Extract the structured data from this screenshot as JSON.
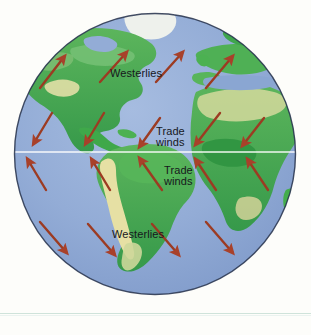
{
  "figure": {
    "background_color": "#fdfdfa",
    "rule_color": "#cfe3da"
  },
  "globe": {
    "center_x": 155,
    "center_y": 154,
    "radius": 141,
    "ocean_color": "#8fa9d4",
    "ocean_color_light": "#9db5dc",
    "land_green": "#3faa4a",
    "land_green_dark": "#2e8b3d",
    "land_green_light": "#7cc47d",
    "desert_tan": "#e8e3a8",
    "ice_white": "#f2f4ef",
    "outline_color": "#1b2a44",
    "equator_color": "#ffffff",
    "equator_y": 152
  },
  "arrows": {
    "color": "#9c3b22",
    "head_color": "#b0442a",
    "stroke_width": 2.4,
    "bands": [
      {
        "name": "north-westerlies",
        "direction": "northeast",
        "count": 4,
        "label": "Westerlies"
      },
      {
        "name": "north-trade-winds",
        "direction": "southwest",
        "count": 5,
        "label": "Trade\nwinds"
      },
      {
        "name": "south-trade-winds",
        "direction": "northwest",
        "count": 5,
        "label": "Trade\nwinds"
      },
      {
        "name": "south-westerlies",
        "direction": "southeast",
        "count": 4,
        "label": "Westerlies"
      }
    ]
  },
  "labels": {
    "north_westerlies": "Westerlies",
    "north_trade_line1": "Trade",
    "north_trade_line2": "winds",
    "south_trade_line1": "Trade",
    "south_trade_line2": "winds",
    "south_westerlies": "Westerlies"
  }
}
